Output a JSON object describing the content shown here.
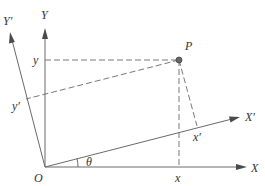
{
  "diagram": {
    "labels": {
      "Y": "Y",
      "X": "X",
      "Yp": "Y′",
      "Xp": "X′",
      "O": "O",
      "P": "P",
      "x": "x",
      "y": "y",
      "xp": "x′",
      "yp": "y′",
      "theta": "θ"
    },
    "colors": {
      "line": "#6a6a6a",
      "arrow": "#4a4a4a",
      "text": "#333333",
      "point": "#666666"
    }
  }
}
